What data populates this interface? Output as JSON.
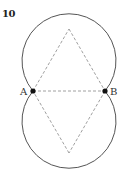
{
  "figure": {
    "number": "10",
    "points": {
      "A": {
        "label": "A",
        "x": 33,
        "y": 91
      },
      "B": {
        "label": "B",
        "x": 105,
        "y": 91
      }
    },
    "rhombus": {
      "top": {
        "x": 69,
        "y": 29
      },
      "bottom": {
        "x": 69,
        "y": 153
      }
    },
    "arcs": [
      {
        "name": "upper",
        "cx": 69,
        "cy": 61,
        "r": 47
      },
      {
        "name": "lower",
        "cx": 69,
        "cy": 121,
        "r": 47
      }
    ],
    "colors": {
      "stroke": "#555555",
      "dashed": "#888888",
      "point": "#111111"
    }
  }
}
